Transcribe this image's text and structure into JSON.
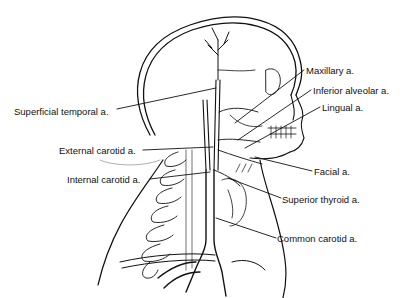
{
  "diagram": {
    "labels": [
      {
        "id": "superficial-temporal",
        "text": "Superficial temporal a.",
        "x": 14,
        "y": 107
      },
      {
        "id": "maxillary",
        "text": "Maxillary a.",
        "x": 306,
        "y": 66
      },
      {
        "id": "inferior-alveolar",
        "text": "Inferior alveolar a.",
        "x": 313,
        "y": 86
      },
      {
        "id": "lingual",
        "text": "Lingual a.",
        "x": 322,
        "y": 103
      },
      {
        "id": "external-carotid",
        "text": "External carotid a.",
        "x": 59,
        "y": 147
      },
      {
        "id": "internal-carotid",
        "text": "Internal carotid a.",
        "x": 67,
        "y": 176
      },
      {
        "id": "facial",
        "text": "Facial a.",
        "x": 314,
        "y": 167
      },
      {
        "id": "superior-thyroid",
        "text": "Superior thyroid a.",
        "x": 282,
        "y": 195
      },
      {
        "id": "common-carotid",
        "text": "Common carotid a.",
        "x": 277,
        "y": 234
      }
    ],
    "colors": {
      "ink": "#111111",
      "background": "#ffffff"
    }
  }
}
